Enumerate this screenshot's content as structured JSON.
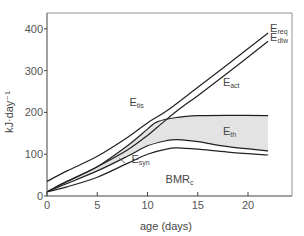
{
  "chart_data": {
    "type": "line",
    "title": "",
    "xlabel": "age (days)",
    "ylabel": "kJ·day⁻¹",
    "xlim": [
      0,
      24
    ],
    "ylim": [
      0,
      430
    ],
    "xticks": [
      0,
      5,
      10,
      15,
      20
    ],
    "yticks": [
      0,
      100,
      200,
      300,
      400
    ],
    "grid": false,
    "series": [
      {
        "name": "E_req",
        "x": [
          0,
          2,
          5,
          8,
          10,
          12,
          15,
          18,
          22
        ],
        "y": [
          35,
          60,
          95,
          140,
          175,
          205,
          260,
          315,
          390
        ]
      },
      {
        "name": "E_dlw",
        "x": [
          0,
          2,
          5,
          8,
          10,
          11,
          13,
          15,
          18,
          22
        ],
        "y": [
          10,
          35,
          70,
          110,
          145,
          165,
          205,
          240,
          295,
          370
        ]
      },
      {
        "name": "E_syn+E_th+BMR_c (upper boundary of E_th)",
        "x": [
          0,
          2,
          5,
          8,
          10,
          11,
          13,
          15,
          18,
          22
        ],
        "y": [
          10,
          35,
          70,
          120,
          160,
          178,
          188,
          192,
          193,
          192
        ]
      },
      {
        "name": "E_syn+BMR_c",
        "x": [
          0,
          2,
          5,
          8,
          10,
          12,
          13,
          15,
          18,
          22
        ],
        "y": [
          10,
          30,
          60,
          95,
          120,
          133,
          135,
          130,
          118,
          108
        ]
      },
      {
        "name": "BMR_c",
        "x": [
          0,
          2,
          5,
          8,
          10,
          12,
          13,
          15,
          18,
          22
        ],
        "y": [
          10,
          22,
          45,
          78,
          100,
          113,
          115,
          112,
          105,
          98
        ]
      }
    ],
    "shaded_region": {
      "name": "E_th",
      "between": [
        "E_syn+E_th+BMR_c (upper boundary of E_th)",
        "E_syn+BMR_c"
      ]
    },
    "annotations": [
      {
        "label": "E",
        "sub": "req",
        "x": 22.2,
        "y": 393
      },
      {
        "label": "E",
        "sub": "dlw",
        "x": 22.2,
        "y": 372
      },
      {
        "label": "E",
        "sub": "tis",
        "x": 8.2,
        "y": 215
      },
      {
        "label": "E",
        "sub": "act",
        "x": 17.5,
        "y": 262
      },
      {
        "label": "E",
        "sub": "th",
        "x": 17.5,
        "y": 147
      },
      {
        "label": "E",
        "sub": "syn",
        "x": 8.4,
        "y": 80
      },
      {
        "label": "BMR",
        "sub": "c",
        "x": 11.8,
        "y": 30
      }
    ]
  }
}
